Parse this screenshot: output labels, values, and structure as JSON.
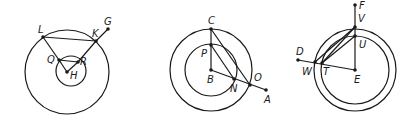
{
  "figures": [
    {
      "id": "fig1",
      "labels": {
        "L": "L",
        "K": "K",
        "G": "G",
        "Q": "Q",
        "R": "R",
        "H": "H"
      }
    },
    {
      "id": "fig2",
      "labels": {
        "C": "C",
        "P": "P",
        "B": "B",
        "N": "N",
        "O": "O",
        "A": "A"
      }
    },
    {
      "id": "fig3",
      "labels": {
        "F": "F",
        "V": "V",
        "U": "U",
        "D": "D",
        "W": "W",
        "T": "T",
        "E": "E"
      }
    }
  ],
  "colors": {
    "stroke": "#1a1a1a",
    "background": "#ffffff"
  }
}
